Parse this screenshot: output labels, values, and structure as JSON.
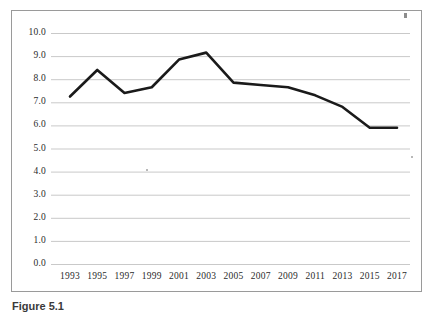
{
  "chart_data": {
    "type": "line",
    "title": "",
    "subtitle": "",
    "xlabel": "",
    "ylabel": "",
    "x": [
      1993,
      1995,
      1997,
      1999,
      2001,
      2003,
      2005,
      2007,
      2009,
      2011,
      2013,
      2015,
      2017
    ],
    "categories": [
      "1993",
      "1995",
      "1997",
      "1999",
      "2001",
      "2003",
      "2005",
      "2007",
      "2009",
      "2011",
      "2013",
      "2015",
      "2017"
    ],
    "values": [
      7.25,
      8.4,
      7.4,
      7.65,
      8.85,
      9.15,
      7.85,
      7.75,
      7.65,
      7.3,
      6.8,
      5.9,
      5.9
    ],
    "series": [
      {
        "name": "series-1",
        "values": [
          7.25,
          8.4,
          7.4,
          7.65,
          8.85,
          9.15,
          7.85,
          7.75,
          7.65,
          7.3,
          6.8,
          5.9,
          5.9
        ],
        "color": "#1a1a1a"
      }
    ],
    "ylim": [
      0.0,
      10.0
    ],
    "ytick_labels": [
      "0.0",
      "1.0",
      "2.0",
      "3.0",
      "4.0",
      "5.0",
      "6.0",
      "7.0",
      "8.0",
      "9.0",
      "10.0"
    ],
    "ytick_values": [
      0.0,
      1.0,
      2.0,
      3.0,
      4.0,
      5.0,
      6.0,
      7.0,
      8.0,
      9.0,
      10.0
    ],
    "xtick_labels": [
      "1993",
      "1995",
      "1997",
      "1999",
      "2001",
      "2003",
      "2005",
      "2007",
      "2009",
      "2011",
      "2013",
      "2015",
      "2017"
    ],
    "grid": "horizontal",
    "grid_color": "#c9c9c9",
    "legend": "none",
    "legend_position": "none",
    "line_color": "#1a1a1a",
    "line_width": 2.6,
    "markers": "none",
    "plot_background": "#ffffff",
    "frame_color": "#9a9a9a"
  },
  "caption": {
    "prefix": "Figure 5.1",
    "rest": ""
  }
}
